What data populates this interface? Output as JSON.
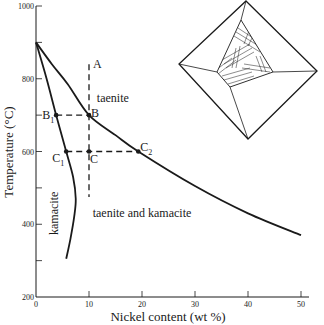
{
  "chart_data": {
    "type": "line",
    "title": "",
    "xlabel": "Nickel content (wt %)",
    "ylabel": "Temperature (°C)",
    "xlim": [
      0,
      50
    ],
    "ylim": [
      200,
      1000
    ],
    "x_ticks": [
      0,
      10,
      20,
      30,
      40,
      50
    ],
    "x_tick_labels": [
      "0",
      "10",
      "20",
      "30",
      "40",
      "50"
    ],
    "y_ticks": [
      200,
      300,
      400,
      500,
      600,
      700,
      800,
      900,
      1000
    ],
    "y_tick_labels": {
      "200": "200",
      "400": "400",
      "600": "600",
      "800": "800",
      "1000": "1000"
    },
    "grid": false,
    "series": [
      {
        "name": "taenite solvus",
        "style": "solid",
        "points": [
          [
            0,
            900
          ],
          [
            3,
            840
          ],
          [
            6,
            785
          ],
          [
            10,
            700
          ],
          [
            15,
            645
          ],
          [
            19.3,
            600
          ],
          [
            30,
            505
          ],
          [
            40,
            430
          ],
          [
            50,
            370
          ]
        ]
      },
      {
        "name": "kamacite solvus",
        "style": "solid",
        "points": [
          [
            0,
            900
          ],
          [
            2,
            800
          ],
          [
            3.8,
            700
          ],
          [
            5.7,
            600
          ],
          [
            7,
            530
          ],
          [
            7.5,
            470
          ],
          [
            7.2,
            420
          ],
          [
            6.5,
            360
          ],
          [
            5.7,
            305
          ]
        ]
      },
      {
        "name": "cooling path A",
        "style": "dashed",
        "points": [
          [
            10,
            840
          ],
          [
            10,
            475
          ]
        ]
      },
      {
        "name": "tie line B1-B",
        "style": "dashed",
        "points": [
          [
            3.8,
            700
          ],
          [
            10,
            700
          ]
        ]
      },
      {
        "name": "tie line C1-C2",
        "style": "dashed",
        "points": [
          [
            5.7,
            600
          ],
          [
            19.3,
            600
          ]
        ]
      }
    ],
    "points": [
      {
        "label": "A",
        "sub": "",
        "x": 10,
        "y": 840,
        "marker": false
      },
      {
        "label": "B",
        "sub": "",
        "x": 10,
        "y": 700,
        "marker": true
      },
      {
        "label": "B",
        "sub": "1",
        "x": 3.8,
        "y": 700,
        "marker": true
      },
      {
        "label": "C",
        "sub": "",
        "x": 10,
        "y": 600,
        "marker": true
      },
      {
        "label": "C",
        "sub": "1",
        "x": 5.7,
        "y": 600,
        "marker": true
      },
      {
        "label": "C",
        "sub": "2",
        "x": 19.3,
        "y": 600,
        "marker": true
      }
    ],
    "annotations": [
      {
        "text": "taenite",
        "x": 14.5,
        "y": 735,
        "rotate": false
      },
      {
        "text": "taenite and kamacite",
        "x": 20,
        "y": 420,
        "rotate": false
      },
      {
        "text": "kamacite",
        "x": 4.2,
        "y": 430,
        "rotate": true
      }
    ],
    "inset": {
      "description": "octahedron with Widmanstätten pattern",
      "name": "octahedron-widmanstatten-inset"
    }
  }
}
